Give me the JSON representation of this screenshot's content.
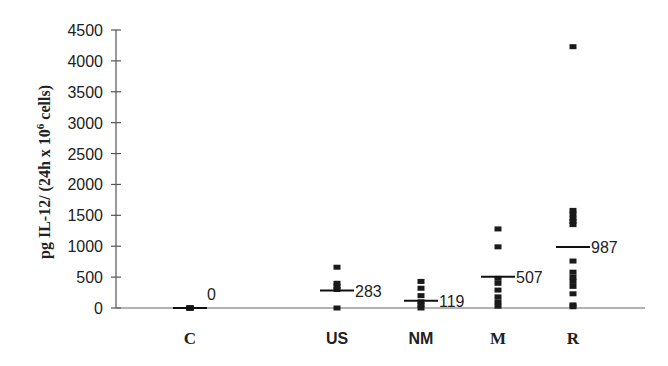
{
  "chart_data": {
    "type": "scatter",
    "title": "",
    "xlabel": "",
    "ylabel": "pg IL-12/ (24h x 10^6 cells)",
    "ylabel_parts": {
      "main": "pg IL-12/ (24h x 10",
      "sup": "6",
      "tail": " cells)"
    },
    "ylim": [
      0,
      4500
    ],
    "yticks": [
      0,
      500,
      1000,
      1500,
      2000,
      2500,
      3000,
      3500,
      4000,
      4500
    ],
    "grid": false,
    "legend": null,
    "categories": [
      "C",
      "US",
      "NM",
      "M",
      "R"
    ],
    "series": [
      {
        "name": "C",
        "points": [
          0,
          0,
          0,
          0,
          0
        ],
        "mean": 0,
        "mean_label": "0"
      },
      {
        "name": "US",
        "points": [
          660,
          400,
          350,
          300,
          0
        ],
        "mean": 283,
        "mean_label": "283"
      },
      {
        "name": "NM",
        "points": [
          430,
          320,
          200,
          100,
          50,
          0
        ],
        "mean": 119,
        "mean_label": "119"
      },
      {
        "name": "M",
        "points": [
          1280,
          990,
          480,
          400,
          290,
          180,
          100,
          30
        ],
        "mean": 507,
        "mean_label": "507"
      },
      {
        "name": "R",
        "points": [
          4230,
          1580,
          1520,
          1450,
          1400,
          1350,
          760,
          580,
          500,
          430,
          350,
          230,
          50,
          20
        ],
        "mean": 987,
        "mean_label": "987"
      }
    ],
    "annotations": [
      "0",
      "283",
      "119",
      "507",
      "987"
    ]
  }
}
